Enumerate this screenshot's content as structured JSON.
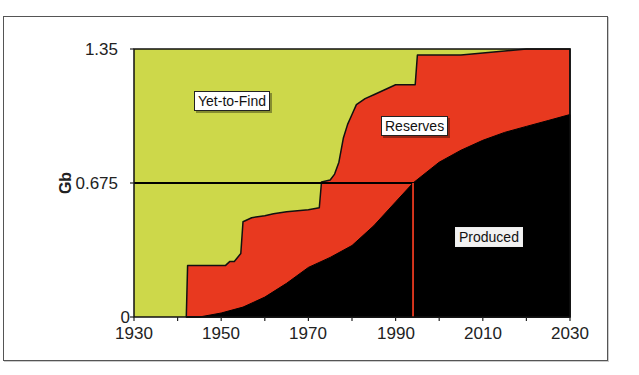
{
  "chart_data": {
    "type": "area",
    "title": "",
    "xlabel": "",
    "ylabel": "Gb",
    "xlim": [
      1930,
      2030
    ],
    "ylim": [
      0,
      1.35
    ],
    "x_ticks": [
      1930,
      1950,
      1970,
      1990,
      2010,
      2030
    ],
    "x_tick_labels": [
      "1930",
      "1950",
      "1970",
      "1990",
      "2010",
      "2030"
    ],
    "x_minor_ticks": [
      1940,
      1960,
      1980,
      2000,
      2020
    ],
    "y_ticks": [
      0,
      0.675,
      1.35
    ],
    "y_tick_labels": [
      "0",
      "0.675",
      "1.35"
    ],
    "grid": false,
    "legend": "none (inline region labels)",
    "region_labels": [
      "Yet-to-Find",
      "Reserves",
      "Produced"
    ],
    "series": [
      {
        "name": "Cumulative Discovery (Produced + Reserves)",
        "x": [
          1942,
          1942.3,
          1951,
          1952,
          1953,
          1954.5,
          1955,
          1957,
          1960,
          1962,
          1965,
          1970,
          1972.5,
          1973,
          1975,
          1976,
          1977,
          1978,
          1979,
          1980,
          1981,
          1983,
          1985,
          1988,
          1990,
          1994.5,
          1995,
          2005,
          2015,
          2020,
          2030
        ],
        "values": [
          0,
          0.26,
          0.26,
          0.28,
          0.28,
          0.32,
          0.48,
          0.5,
          0.51,
          0.52,
          0.53,
          0.54,
          0.55,
          0.68,
          0.69,
          0.72,
          0.78,
          0.9,
          0.97,
          1.02,
          1.07,
          1.1,
          1.12,
          1.15,
          1.17,
          1.17,
          1.32,
          1.32,
          1.34,
          1.35,
          1.35
        ]
      },
      {
        "name": "Produced",
        "x": [
          1942,
          1945,
          1950,
          1955,
          1960,
          1965,
          1970,
          1975,
          1980,
          1985,
          1990,
          1994,
          2000,
          2005,
          2010,
          2015,
          2020,
          2025,
          2030
        ],
        "values": [
          0,
          0.0,
          0.02,
          0.05,
          0.1,
          0.17,
          0.25,
          0.3,
          0.36,
          0.46,
          0.58,
          0.675,
          0.78,
          0.84,
          0.89,
          0.93,
          0.96,
          0.99,
          1.02
        ]
      },
      {
        "name": "Yet-to-Find",
        "description": "Area above cumulative discovery up to ultimate 1.35 Gb"
      }
    ],
    "annotations": [
      {
        "type": "hline",
        "y": 0.675,
        "x_from": 1930,
        "x_to": 1994,
        "color": "#000000",
        "meaning": "Midpoint (half of ultimate)"
      },
      {
        "type": "vline",
        "x": 1994,
        "y_from": 0,
        "y_to": 0.675,
        "color": "#e8391f",
        "meaning": "Midpoint of depletion"
      }
    ],
    "colors": {
      "yet_to_find": "#cdd84a",
      "reserves": "#e8391f",
      "produced": "#000000"
    }
  },
  "axes": {
    "ylabel": "Gb",
    "y_labels": [
      "1.35",
      "0.675",
      "0"
    ],
    "x_labels": [
      "1930",
      "1950",
      "1970",
      "1990",
      "2010",
      "2030"
    ]
  },
  "labels": {
    "yet_to_find": "Yet-to-Find",
    "reserves": "Reserves",
    "produced": "Produced"
  }
}
